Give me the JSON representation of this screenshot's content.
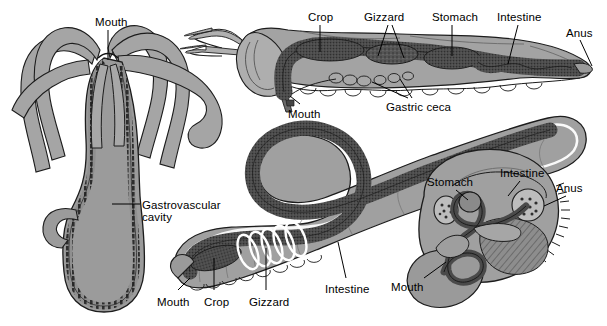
{
  "figure": {
    "background_color": "#ffffff",
    "text_color": "#000000",
    "body_fill": "#9a9a9a",
    "body_fill_light": "#b4b4b4",
    "body_fill_dark": "#808080",
    "gut_dark": "#4a4a4a",
    "outline_color": "#1a1a1a",
    "highlight_color": "#ffffff"
  },
  "panels": [
    {
      "id": "hydra",
      "name": "hydra-gastrovascular-cavity",
      "description": "Hydra with tentacles and a single opening leading to a gastrovascular cavity",
      "labels": [
        {
          "text": "Mouth",
          "x": 95,
          "y": 16,
          "leader": true
        },
        {
          "text": "Gastrovascular",
          "x": 142,
          "y": 199,
          "leader": true
        },
        {
          "text": "cavity",
          "x": 142,
          "y": 211,
          "leader": false
        }
      ]
    },
    {
      "id": "grasshopper",
      "name": "grasshopper-digestive-tract",
      "description": "Grasshopper with complete digestive tract from mouth to anus",
      "labels": [
        {
          "text": "Crop",
          "x": 308,
          "y": 11,
          "leader": true
        },
        {
          "text": "Gizzard",
          "x": 364,
          "y": 11,
          "leader": true
        },
        {
          "text": "Stomach",
          "x": 432,
          "y": 11,
          "leader": true
        },
        {
          "text": "Intestine",
          "x": 497,
          "y": 11,
          "leader": true
        },
        {
          "text": "Anus",
          "x": 566,
          "y": 27,
          "leader": true
        },
        {
          "text": "Gastric ceca",
          "x": 386,
          "y": 101,
          "leader": true
        },
        {
          "text": "Mouth",
          "x": 288,
          "y": 108,
          "leader": true
        }
      ]
    },
    {
      "id": "earthworm",
      "name": "earthworm-digestive-tract",
      "description": "Earthworm with complete digestive tract coiled in an S shape",
      "labels": [
        {
          "text": "Mouth",
          "x": 157,
          "y": 296,
          "leader": true
        },
        {
          "text": "Crop",
          "x": 204,
          "y": 296,
          "leader": true
        },
        {
          "text": "Gizzard",
          "x": 249,
          "y": 296,
          "leader": true
        },
        {
          "text": "Intestine",
          "x": 325,
          "y": 283,
          "leader": true
        }
      ]
    },
    {
      "id": "bivalve",
      "name": "bivalve-digestive-tract",
      "description": "Bivalve mollusc cross section showing coiled gut",
      "labels": [
        {
          "text": "Stomach",
          "x": 427,
          "y": 176,
          "leader": true
        },
        {
          "text": "Intestine",
          "x": 500,
          "y": 167,
          "leader": true
        },
        {
          "text": "Anus",
          "x": 556,
          "y": 182,
          "leader": true
        },
        {
          "text": "Mouth",
          "x": 391,
          "y": 281,
          "leader": true
        }
      ]
    }
  ]
}
